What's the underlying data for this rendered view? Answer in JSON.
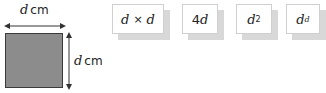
{
  "figure": {
    "square": {
      "fill": "#8c8c8c",
      "border": "#3a3a3a"
    },
    "top_dimension": {
      "variable": "d",
      "unit": "cm"
    },
    "side_dimension": {
      "variable": "d",
      "unit": "cm"
    }
  },
  "cards": [
    {
      "left": "d",
      "op": "×",
      "right": "d"
    },
    {
      "coef": "4",
      "var": "d"
    },
    {
      "base": "d",
      "exp": "2"
    },
    {
      "base": "d",
      "exp": "d"
    }
  ]
}
